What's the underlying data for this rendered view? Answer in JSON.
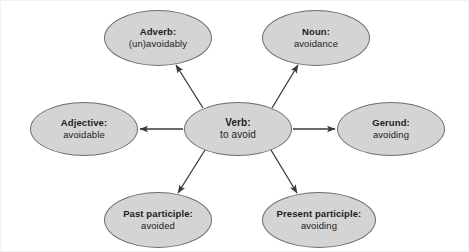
{
  "diagram": {
    "type": "word-family-hub-and-spoke",
    "background_color": "#ffffff",
    "node_fill_color": "#d4d4d4",
    "node_stroke_color": "#6e6e6e",
    "text_color": "#1d1d1f",
    "edge_color": "#3a3a3a",
    "center": {
      "id": "verb",
      "title": "Verb:",
      "value": "to avoid",
      "cx": 238,
      "cy": 129,
      "rx": 54,
      "ry": 27
    },
    "nodes": [
      {
        "id": "adverb",
        "title": "Adverb:",
        "value": "(un)avoidably",
        "cx": 158,
        "cy": 38,
        "rx": 54,
        "ry": 28,
        "arrow_from_center": true
      },
      {
        "id": "noun",
        "title": "Noun:",
        "value": "avoidance",
        "cx": 316,
        "cy": 38,
        "rx": 54,
        "ry": 28,
        "arrow_from_center": true
      },
      {
        "id": "adjective",
        "title": "Adjective:",
        "value": "avoidable",
        "cx": 84,
        "cy": 129,
        "rx": 54,
        "ry": 27,
        "arrow_from_center": true
      },
      {
        "id": "gerund",
        "title": "Gerund:",
        "value": "avoiding",
        "cx": 391,
        "cy": 129,
        "rx": 54,
        "ry": 27,
        "arrow_from_center": true
      },
      {
        "id": "past-participle",
        "title": "Past participle:",
        "value": "avoided",
        "cx": 158,
        "cy": 220,
        "rx": 54,
        "ry": 28,
        "arrow_from_center": true
      },
      {
        "id": "present-participle",
        "title": "Present participle:",
        "value": "avoiding",
        "cx": 319,
        "cy": 220,
        "rx": 57,
        "ry": 28,
        "arrow_from_center": true
      }
    ]
  }
}
